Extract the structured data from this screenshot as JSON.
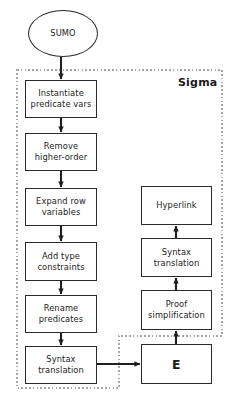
{
  "diagram": {
    "background_color": "#ffffff",
    "stroke_color": "#2b2b2b",
    "dashed_color": "#9a9a9a",
    "region": {
      "label": "Sigma",
      "style": "dashed"
    },
    "nodes": [
      {
        "id": "sumo",
        "label": "SUMO",
        "shape": "ellipse",
        "x": 28,
        "y": 10,
        "w": 70,
        "h": 47
      },
      {
        "id": "instantiate-predicate-vars",
        "label": "Instantiate\npredicate vars",
        "shape": "rect",
        "x": 25,
        "y": 80,
        "w": 72,
        "h": 38
      },
      {
        "id": "remove-higher-order",
        "label": "Remove\nhigher-order",
        "shape": "rect",
        "x": 25,
        "y": 133,
        "w": 72,
        "h": 38
      },
      {
        "id": "expand-row-variables",
        "label": "Expand row\nvariables",
        "shape": "rect",
        "x": 25,
        "y": 188,
        "w": 72,
        "h": 38
      },
      {
        "id": "add-type-constraints",
        "label": "Add type\nconstraints",
        "shape": "rect",
        "x": 25,
        "y": 242,
        "w": 72,
        "h": 39
      },
      {
        "id": "rename-predicates",
        "label": "Rename\npredicates",
        "shape": "rect",
        "x": 25,
        "y": 295,
        "w": 72,
        "h": 38
      },
      {
        "id": "syntax-translation-left",
        "label": "Syntax\ntranslation",
        "shape": "rect",
        "x": 25,
        "y": 346,
        "w": 72,
        "h": 38
      },
      {
        "id": "e-prover",
        "label": "E",
        "shape": "rect",
        "x": 141,
        "y": 344,
        "w": 71,
        "h": 40
      },
      {
        "id": "proof-simplification",
        "label": "Proof\nsimplification",
        "shape": "rect",
        "x": 141,
        "y": 290,
        "w": 71,
        "h": 40
      },
      {
        "id": "syntax-translation-right",
        "label": "Syntax\ntranslation",
        "shape": "rect",
        "x": 141,
        "y": 238,
        "w": 71,
        "h": 39
      },
      {
        "id": "hyperlink",
        "label": "Hyperlink",
        "shape": "rect",
        "x": 141,
        "y": 186,
        "w": 71,
        "h": 39
      }
    ],
    "edges": [
      {
        "id": "sumo-to-instantiate",
        "from": "sumo",
        "to": "instantiate-predicate-vars",
        "direction": "down"
      },
      {
        "id": "instantiate-to-remove",
        "from": "instantiate-predicate-vars",
        "to": "remove-higher-order",
        "direction": "down"
      },
      {
        "id": "remove-to-expand",
        "from": "remove-higher-order",
        "to": "expand-row-variables",
        "direction": "down"
      },
      {
        "id": "expand-to-addtype",
        "from": "expand-row-variables",
        "to": "add-type-constraints",
        "direction": "down"
      },
      {
        "id": "addtype-to-rename",
        "from": "add-type-constraints",
        "to": "rename-predicates",
        "direction": "down"
      },
      {
        "id": "rename-to-syntax",
        "from": "rename-predicates",
        "to": "syntax-translation-left",
        "direction": "down"
      },
      {
        "id": "syntax-to-e",
        "from": "syntax-translation-left",
        "to": "e-prover",
        "direction": "right"
      },
      {
        "id": "e-to-proof",
        "from": "e-prover",
        "to": "proof-simplification",
        "direction": "up"
      },
      {
        "id": "proof-to-syntax-right",
        "from": "proof-simplification",
        "to": "syntax-translation-right",
        "direction": "up"
      },
      {
        "id": "syntax-right-to-hyperlink",
        "from": "syntax-translation-right",
        "to": "hyperlink",
        "direction": "up"
      }
    ]
  }
}
